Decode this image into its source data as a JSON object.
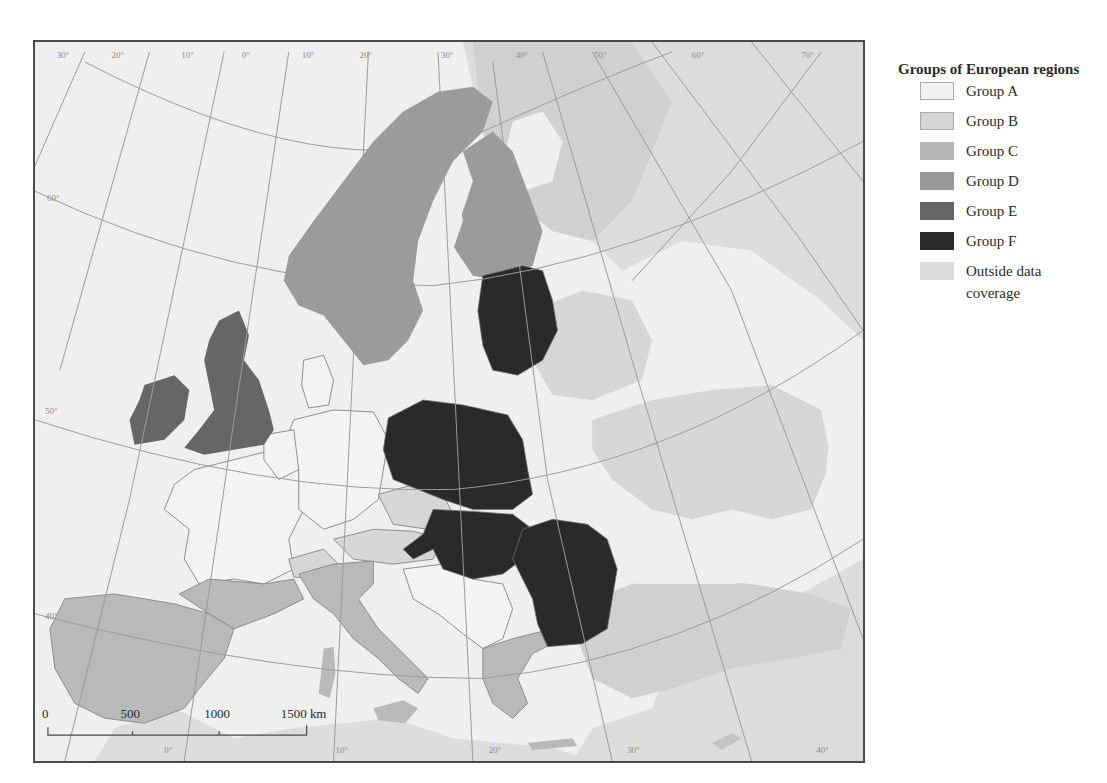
{
  "legend": {
    "title": "Groups of European regions",
    "items": [
      {
        "label": "Group A",
        "color": "#f1f1f1",
        "border": "#a8a8a8"
      },
      {
        "label": "Group B",
        "color": "#d6d6d6",
        "border": "#a8a8a8"
      },
      {
        "label": "Group C",
        "color": "#b7b7b7",
        "border": "#b7b7b7"
      },
      {
        "label": "Group D",
        "color": "#999999",
        "border": "#999999"
      },
      {
        "label": "Group E",
        "color": "#666666",
        "border": "#666666"
      },
      {
        "label": "Group F",
        "color": "#2a2a2a",
        "border": "#2a2a2a"
      },
      {
        "label": "Outside data coverage",
        "color": "#dcdcdc",
        "border": "#dcdcdc"
      }
    ]
  },
  "map": {
    "longitude_labels_top": [
      "30°",
      "20°",
      "10°",
      "0°",
      "10°",
      "20°",
      "30°",
      "40°",
      "50°",
      "60°",
      "70°"
    ],
    "latitude_labels_left": [
      "60°",
      "50°",
      "40°"
    ],
    "longitude_labels_bottom": [
      "0°",
      "10°",
      "20°",
      "30°",
      "40°"
    ],
    "sea_color": "#efefef",
    "graticule_color": "#9a9a9a",
    "border_color": "#8c8c8c"
  },
  "scale_bar": {
    "ticks": [
      "0",
      "500",
      "1000",
      "1500 km"
    ]
  },
  "regions": {
    "group_a": [
      "France",
      "Germany",
      "Benelux",
      "Denmark",
      "Slovenia",
      "Croatia",
      "Serbia",
      "Bulgaria(coast)"
    ],
    "group_b": [
      "Czechia",
      "Austria",
      "Switzerland",
      "Belarus",
      "Ukraine"
    ],
    "group_c": [
      "Spain",
      "Portugal",
      "Italy",
      "Greece",
      "Cyprus",
      "Turkey",
      "Russia(west)"
    ],
    "group_d": [
      "Norway",
      "Sweden",
      "Finland"
    ],
    "group_e": [
      "United Kingdom",
      "Ireland"
    ],
    "group_f": [
      "Estonia",
      "Latvia",
      "Lithuania",
      "Poland",
      "Slovakia",
      "Hungary",
      "Romania",
      "Bulgaria"
    ]
  }
}
